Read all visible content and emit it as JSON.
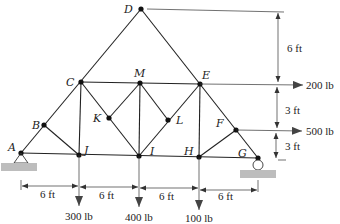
{
  "diagram": {
    "type": "truss",
    "nodes": [
      {
        "id": "A",
        "x": 21,
        "y": 153
      },
      {
        "id": "B",
        "x": 44,
        "y": 125
      },
      {
        "id": "C",
        "x": 81,
        "y": 82
      },
      {
        "id": "D",
        "x": 141,
        "y": 9
      },
      {
        "id": "E",
        "x": 200,
        "y": 84
      },
      {
        "id": "F",
        "x": 236,
        "y": 130
      },
      {
        "id": "G",
        "x": 258,
        "y": 158
      },
      {
        "id": "H",
        "x": 199,
        "y": 157
      },
      {
        "id": "I",
        "x": 139,
        "y": 156
      },
      {
        "id": "J",
        "x": 79,
        "y": 155
      },
      {
        "id": "K",
        "x": 109,
        "y": 118
      },
      {
        "id": "L",
        "x": 168,
        "y": 120
      },
      {
        "id": "M",
        "x": 140,
        "y": 83
      }
    ],
    "labels": {
      "A": "A",
      "B": "B",
      "C": "C",
      "D": "D",
      "E": "E",
      "F": "F",
      "G": "G",
      "H": "H",
      "I": "I",
      "J": "J",
      "K": "K",
      "L": "L",
      "M": "M"
    },
    "loads": {
      "j_load": "300 lb",
      "i_load": "400 lb",
      "h_load": "100 lb",
      "e_load": "200 lb",
      "f_load": "500 lb"
    },
    "dimensions": {
      "span_1": "6 ft",
      "span_2": "6 ft",
      "span_3": "6 ft",
      "span_4": "6 ft",
      "height_top": "6 ft",
      "height_mid": "3 ft",
      "height_bottom": "3 ft"
    },
    "supports": {
      "left": "pin",
      "right": "roller"
    }
  }
}
